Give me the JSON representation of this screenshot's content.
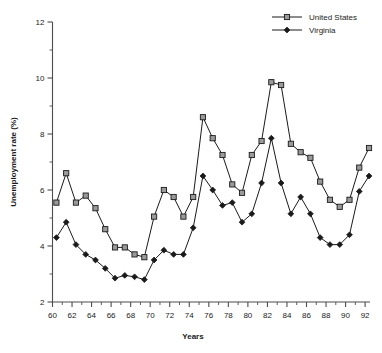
{
  "chart_data": {
    "type": "line",
    "title": "",
    "subtitle": "",
    "xlabel": "Years",
    "ylabel": "Unemployment rate (%)",
    "xlim": [
      60,
      92.5
    ],
    "ylim": [
      2,
      12
    ],
    "y_major_ticks": [
      2,
      4,
      6,
      8,
      10,
      12
    ],
    "y_minor_ticks": [
      3,
      5,
      7,
      9,
      11
    ],
    "x_major_ticks": [
      60,
      62,
      64,
      66,
      68,
      70,
      72,
      74,
      76,
      78,
      80,
      82,
      84,
      86,
      88,
      90,
      92
    ],
    "x_minor_ticks": [
      61,
      63,
      65,
      67,
      69,
      71,
      73,
      75,
      77,
      79,
      81,
      83,
      85,
      87,
      89,
      91
    ],
    "x_tick_labels": [
      "60",
      "62",
      "64",
      "66",
      "68",
      "70",
      "72",
      "74",
      "76",
      "78",
      "80",
      "82",
      "84",
      "86",
      "88",
      "90",
      "92"
    ],
    "y_tick_labels": [
      "2",
      "4",
      "6",
      "8",
      "10",
      "12"
    ],
    "grid": false,
    "legend_position": "top-right",
    "x": [
      60.4,
      61.4,
      62.4,
      63.4,
      64.4,
      65.4,
      66.4,
      67.4,
      68.4,
      69.4,
      70.4,
      71.4,
      72.4,
      73.4,
      74.4,
      75.4,
      76.4,
      77.4,
      78.4,
      79.4,
      80.4,
      81.4,
      82.4,
      83.4,
      84.4,
      85.4,
      86.4,
      87.4,
      88.4,
      89.4,
      90.4,
      91.4,
      92.4
    ],
    "series": [
      {
        "name": "United States",
        "marker": "open-square",
        "color": "#1a1a1a",
        "values": [
          5.55,
          6.6,
          5.55,
          5.8,
          5.35,
          4.6,
          3.95,
          3.95,
          3.7,
          3.6,
          5.05,
          6.0,
          5.75,
          5.05,
          5.75,
          8.6,
          7.85,
          7.25,
          6.2,
          5.9,
          7.25,
          7.75,
          9.85,
          9.75,
          7.65,
          7.35,
          7.15,
          6.3,
          5.65,
          5.4,
          5.65,
          6.8,
          7.5
        ]
      },
      {
        "name": "Virginia",
        "marker": "filled-diamond",
        "color": "#1a1a1a",
        "values": [
          4.3,
          4.85,
          4.05,
          3.7,
          3.5,
          3.2,
          2.85,
          2.95,
          2.9,
          2.8,
          3.5,
          3.85,
          3.7,
          3.7,
          4.65,
          6.5,
          6.0,
          5.45,
          5.55,
          4.85,
          5.15,
          6.25,
          7.85,
          6.25,
          5.15,
          5.75,
          5.15,
          4.3,
          4.05,
          4.05,
          4.4,
          5.95,
          6.5
        ]
      }
    ],
    "legend": [
      {
        "label": "United States",
        "marker": "open-square"
      },
      {
        "label": "Virginia",
        "marker": "filled-diamond"
      }
    ]
  }
}
